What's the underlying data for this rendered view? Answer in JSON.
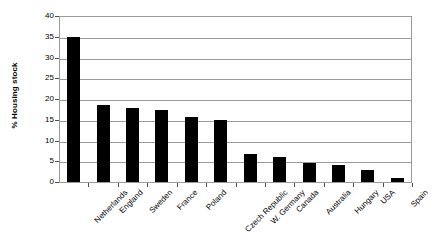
{
  "chart_data": {
    "type": "bar",
    "title": "",
    "subtitle": "",
    "xlabel": "",
    "ylabel": "% Housing stock",
    "ylim": [
      0,
      40
    ],
    "yticks": [
      0,
      5,
      10,
      15,
      20,
      25,
      30,
      35,
      40
    ],
    "ytick_labels": [
      "0",
      "5",
      "10",
      "15",
      "20",
      "25",
      "30",
      "35",
      "40"
    ],
    "grid": "horizontal",
    "legend": "none",
    "bar_color": "#000000",
    "categories": [
      "Netherlands",
      "England",
      "Sweden",
      "France",
      "Poland",
      "Czech Republic",
      "W. Germany",
      "Canada",
      "Australia",
      "Hungary",
      "USA",
      "Spain"
    ],
    "values": [
      35,
      18.5,
      17.8,
      17.4,
      15.6,
      15,
      6.8,
      6,
      4.7,
      4,
      3,
      0.9
    ]
  }
}
